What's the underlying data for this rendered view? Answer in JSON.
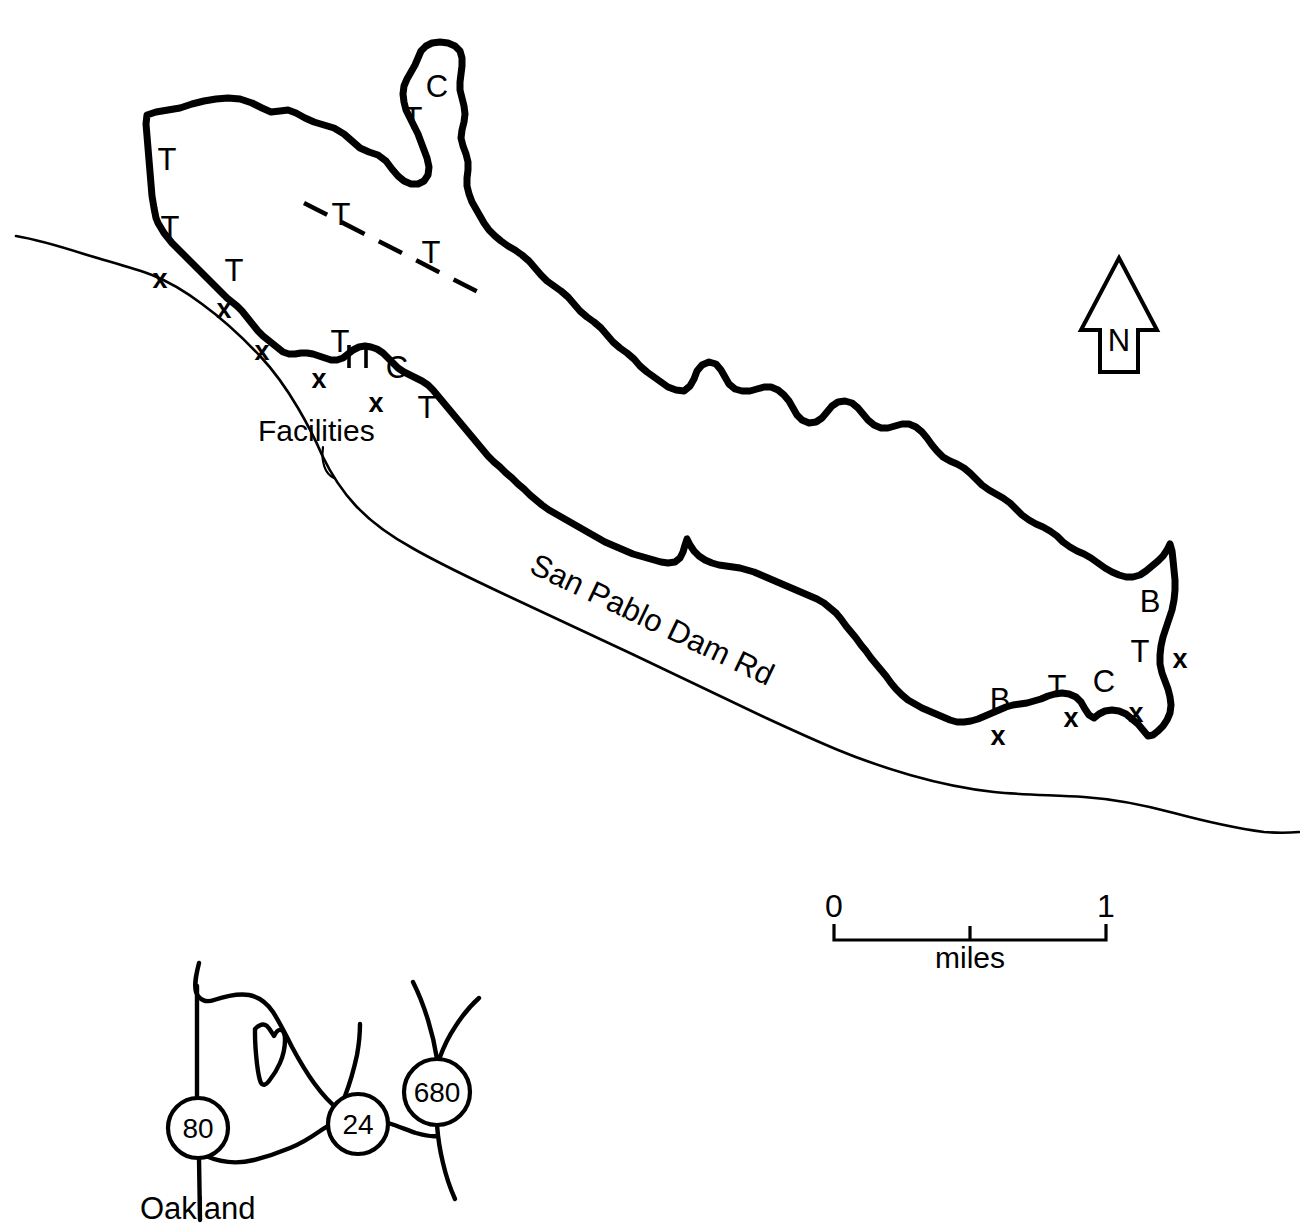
{
  "map": {
    "title_visible": false,
    "features": {
      "reservoir_name_implied": "San Pablo Reservoir",
      "road_label": "San Pablo  Dam  Rd",
      "facilities_label": "Facilities"
    },
    "shore_markers": [
      {
        "id": "m1",
        "label": "T",
        "x": 167,
        "y": 170
      },
      {
        "id": "m2",
        "label": "T",
        "x": 170,
        "y": 238
      },
      {
        "id": "m3",
        "label": "T",
        "x": 234,
        "y": 281
      },
      {
        "id": "m4",
        "label": "T",
        "x": 340,
        "y": 352
      },
      {
        "id": "m5",
        "label": "T",
        "x": 415,
        "y": 418
      },
      {
        "id": "m6",
        "label": "T",
        "x": 413,
        "y": 129
      },
      {
        "id": "m7",
        "label": "C",
        "x": 433,
        "y": 97
      },
      {
        "id": "m8",
        "label": "C",
        "x": 397,
        "y": 378
      },
      {
        "id": "m9",
        "label": "T",
        "x": 341,
        "y": 219
      },
      {
        "id": "m10",
        "label": "T",
        "x": 431,
        "y": 257
      },
      {
        "id": "m11",
        "label": "B",
        "x": 1150,
        "y": 612
      },
      {
        "id": "m12",
        "label": "T",
        "x": 1140,
        "y": 660
      },
      {
        "id": "m13",
        "label": "C",
        "x": 1102,
        "y": 692
      },
      {
        "id": "m14",
        "label": "T",
        "x": 1057,
        "y": 697
      },
      {
        "id": "m15",
        "label": "B",
        "x": 1000,
        "y": 707
      }
    ],
    "x_markers": [
      {
        "id": "x1",
        "x": 160,
        "y": 288
      },
      {
        "id": "x2",
        "x": 224,
        "y": 318
      },
      {
        "id": "x3",
        "x": 262,
        "y": 357
      },
      {
        "id": "x4",
        "x": 319,
        "y": 386
      },
      {
        "id": "x5",
        "x": 376,
        "y": 409
      },
      {
        "id": "x6",
        "x": 1180,
        "y": 665
      },
      {
        "id": "x7",
        "x": 1136,
        "y": 718
      },
      {
        "id": "x8",
        "x": 1071,
        "y": 724
      },
      {
        "id": "x9",
        "x": 998,
        "y": 742
      }
    ],
    "marker_glyph": "x",
    "legend_codes": {
      "T": "T",
      "C": "C",
      "B": "B",
      "x": "x"
    },
    "north_arrow": {
      "label": "N"
    },
    "scale_bar": {
      "min_label": "0",
      "max_label": "1",
      "unit_label": "miles",
      "min_value": 0,
      "max_value": 1,
      "midpoint_tick": true
    },
    "inset": {
      "shields": [
        {
          "id": "i80",
          "label": "80",
          "cx": 198,
          "cy": 1128,
          "r": 30
        },
        {
          "id": "i24",
          "label": "24",
          "cx": 358,
          "cy": 1124,
          "r": 30
        },
        {
          "id": "i680",
          "label": "680",
          "cx": 437,
          "cy": 1092,
          "r": 33
        }
      ],
      "city_label": "Oakland"
    }
  },
  "colors": {
    "ink": "#000000",
    "paper": "#ffffff"
  }
}
